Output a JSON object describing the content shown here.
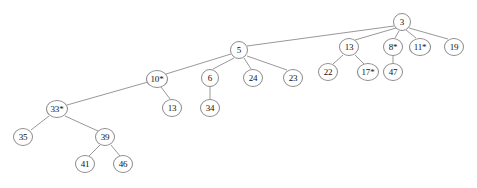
{
  "diagram": {
    "type": "tree",
    "background_color": "#ffffff",
    "node_fill": "#ffffff",
    "node_stroke": "#8c8c8c",
    "edge_color": "#8c8c8c",
    "text_color": "#111111",
    "width": 477,
    "height": 188
  },
  "nodes": [
    {
      "id": "n3",
      "label": "3",
      "x": 402,
      "y": 22,
      "rx": 9,
      "ry": 9,
      "font_size": 9
    },
    {
      "id": "n13a",
      "label": "13",
      "x": 349,
      "y": 47,
      "rx": 10,
      "ry": 9,
      "font_size": 9
    },
    {
      "id": "n8",
      "label": "8*",
      "x": 393,
      "y": 47,
      "rx": 10,
      "ry": 9,
      "font_size": 9
    },
    {
      "id": "n11",
      "label": "11*",
      "x": 420,
      "y": 47,
      "rx": 11,
      "ry": 9,
      "font_size": 9
    },
    {
      "id": "n19",
      "label": "19",
      "x": 454,
      "y": 47,
      "rx": 10,
      "ry": 9,
      "font_size": 9
    },
    {
      "id": "n5",
      "label": "5",
      "x": 239,
      "y": 50,
      "rx": 9,
      "ry": 9,
      "font_size": 9
    },
    {
      "id": "n22",
      "label": "22",
      "x": 328,
      "y": 72,
      "rx": 10,
      "ry": 9,
      "font_size": 9
    },
    {
      "id": "n17",
      "label": "17*",
      "x": 368,
      "y": 72,
      "rx": 11,
      "ry": 9,
      "font_size": 9
    },
    {
      "id": "n47",
      "label": "47",
      "x": 393,
      "y": 72,
      "rx": 10,
      "ry": 9,
      "font_size": 9
    },
    {
      "id": "n10",
      "label": "10*",
      "x": 157,
      "y": 79,
      "rx": 11,
      "ry": 9,
      "font_size": 9
    },
    {
      "id": "n6",
      "label": "6",
      "x": 210,
      "y": 78,
      "rx": 9,
      "ry": 9,
      "font_size": 9
    },
    {
      "id": "n24",
      "label": "24",
      "x": 253,
      "y": 78,
      "rx": 10,
      "ry": 9,
      "font_size": 9
    },
    {
      "id": "n23",
      "label": "23",
      "x": 293,
      "y": 78,
      "rx": 10,
      "ry": 9,
      "font_size": 9
    },
    {
      "id": "n13b",
      "label": "13",
      "x": 172,
      "y": 108,
      "rx": 10,
      "ry": 9,
      "font_size": 9
    },
    {
      "id": "n34",
      "label": "34",
      "x": 210,
      "y": 108,
      "rx": 10,
      "ry": 9,
      "font_size": 9
    },
    {
      "id": "n33",
      "label": "33*",
      "x": 57,
      "y": 109,
      "rx": 11,
      "ry": 9,
      "font_size": 9
    },
    {
      "id": "n35",
      "label": "35",
      "x": 23,
      "y": 137,
      "rx": 10,
      "ry": 9,
      "font_size": 9
    },
    {
      "id": "n39",
      "label": "39",
      "x": 105,
      "y": 137,
      "rx": 10,
      "ry": 9,
      "font_size": 9
    },
    {
      "id": "n41",
      "label": "41",
      "x": 85,
      "y": 164,
      "rx": 10,
      "ry": 9,
      "font_size": 9
    },
    {
      "id": "n46",
      "label": "46",
      "x": 123,
      "y": 164,
      "rx": 10,
      "ry": 9,
      "font_size": 9
    }
  ],
  "edges": [
    {
      "id": "e-3-5",
      "from": "n3",
      "to": "n5",
      "x1": 394,
      "y1": 26,
      "x2": 247,
      "y2": 46
    },
    {
      "id": "e-3-13a",
      "from": "n3",
      "to": "n13a",
      "x1": 396,
      "y1": 28,
      "x2": 355,
      "y2": 40
    },
    {
      "id": "e-3-8",
      "from": "n3",
      "to": "n8",
      "x1": 399,
      "y1": 31,
      "x2": 395,
      "y2": 38
    },
    {
      "id": "e-3-11",
      "from": "n3",
      "to": "n11",
      "x1": 406,
      "y1": 30,
      "x2": 416,
      "y2": 38
    },
    {
      "id": "e-3-19",
      "from": "n3",
      "to": "n19",
      "x1": 409,
      "y1": 28,
      "x2": 448,
      "y2": 39
    },
    {
      "id": "e-13a-22",
      "from": "n13a",
      "to": "n22",
      "x1": 343,
      "y1": 55,
      "x2": 333,
      "y2": 64
    },
    {
      "id": "e-13a-17",
      "from": "n13a",
      "to": "n17",
      "x1": 355,
      "y1": 55,
      "x2": 364,
      "y2": 64
    },
    {
      "id": "e-8-47",
      "from": "n8",
      "to": "n47",
      "x1": 393,
      "y1": 56,
      "x2": 393,
      "y2": 63
    },
    {
      "id": "e-5-10",
      "from": "n5",
      "to": "n10",
      "x1": 231,
      "y1": 54,
      "x2": 166,
      "y2": 74
    },
    {
      "id": "e-5-6",
      "from": "n5",
      "to": "n6",
      "x1": 234,
      "y1": 58,
      "x2": 213,
      "y2": 69
    },
    {
      "id": "e-5-24",
      "from": "n5",
      "to": "n24",
      "x1": 244,
      "y1": 58,
      "x2": 251,
      "y2": 69
    },
    {
      "id": "e-5-23",
      "from": "n5",
      "to": "n23",
      "x1": 247,
      "y1": 56,
      "x2": 287,
      "y2": 70
    },
    {
      "id": "e-10-13b",
      "from": "n10",
      "to": "n13b",
      "x1": 161,
      "y1": 87,
      "x2": 170,
      "y2": 99
    },
    {
      "id": "e-6-34",
      "from": "n6",
      "to": "n34",
      "x1": 210,
      "y1": 87,
      "x2": 210,
      "y2": 99
    },
    {
      "id": "e-10-33",
      "from": "n10",
      "to": "n33",
      "x1": 148,
      "y1": 82,
      "x2": 67,
      "y2": 105
    },
    {
      "id": "e-33-35",
      "from": "n33",
      "to": "n35",
      "x1": 49,
      "y1": 116,
      "x2": 31,
      "y2": 130
    },
    {
      "id": "e-33-39",
      "from": "n33",
      "to": "n39",
      "x1": 65,
      "y1": 116,
      "x2": 98,
      "y2": 131
    },
    {
      "id": "e-39-41",
      "from": "n39",
      "to": "n41",
      "x1": 100,
      "y1": 145,
      "x2": 89,
      "y2": 156
    },
    {
      "id": "e-39-46",
      "from": "n39",
      "to": "n46",
      "x1": 111,
      "y1": 145,
      "x2": 120,
      "y2": 156
    }
  ]
}
